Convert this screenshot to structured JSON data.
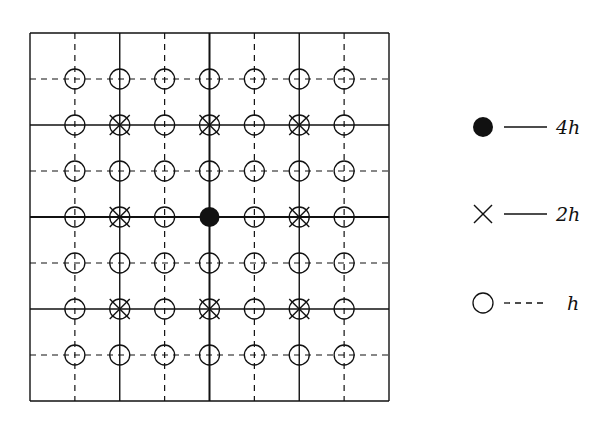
{
  "diagram": {
    "type": "multigrid",
    "grid": {
      "left": 30,
      "top": 33,
      "right": 389,
      "bottom": 401,
      "cells": 8,
      "line_color": "#111111",
      "levels": {
        "4h": {
          "indices": [
            4
          ],
          "style": "solid-thick"
        },
        "2h": {
          "indices": [
            2,
            6
          ],
          "style": "solid"
        },
        "h": {
          "indices": [
            1,
            3,
            5,
            7
          ],
          "style": "dashed"
        }
      }
    },
    "points": {
      "circle_nodes": "all interior intersections (7x7)",
      "cross_nodes": [
        [
          2,
          2
        ],
        [
          2,
          4
        ],
        [
          2,
          6
        ],
        [
          4,
          2
        ],
        [
          4,
          6
        ],
        [
          6,
          2
        ],
        [
          6,
          4
        ],
        [
          6,
          6
        ]
      ],
      "filled_nodes": [
        [
          4,
          4
        ]
      ]
    },
    "legend": [
      {
        "marker": "filled-circle",
        "line": "solid",
        "label": "4h"
      },
      {
        "marker": "cross",
        "line": "solid",
        "label": "2h"
      },
      {
        "marker": "open-circle",
        "line": "dashed",
        "label": "h"
      }
    ]
  }
}
